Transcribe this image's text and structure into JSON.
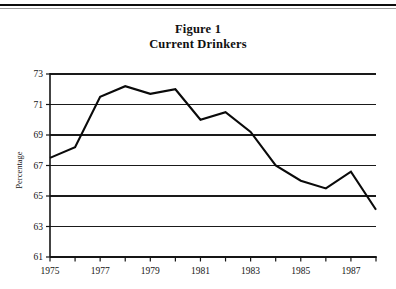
{
  "page": {
    "top_rule": "horizontal-rule"
  },
  "title": {
    "line1": "Figure 1",
    "line2": "Current Drinkers"
  },
  "chart_data": {
    "type": "line",
    "xlabel": "",
    "ylabel": "Percentage",
    "x": [
      1975,
      1976,
      1977,
      1978,
      1979,
      1980,
      1981,
      1982,
      1983,
      1984,
      1985,
      1986,
      1987,
      1988
    ],
    "values": [
      67.5,
      68.2,
      71.5,
      72.2,
      71.7,
      72.0,
      70.0,
      70.5,
      69.2,
      67.0,
      66.0,
      65.5,
      66.6,
      64.1
    ],
    "series": [
      {
        "name": "Current Drinkers",
        "values": [
          67.5,
          68.2,
          71.5,
          72.2,
          71.7,
          72.0,
          70.0,
          70.5,
          69.2,
          67.0,
          66.0,
          65.5,
          66.6,
          64.1
        ]
      }
    ],
    "xlim": [
      1975,
      1988
    ],
    "ylim": [
      61,
      73
    ],
    "ytick_values": [
      73,
      71,
      69,
      67,
      65,
      63,
      61
    ],
    "ytick_labels": [
      "73",
      "71",
      "69",
      "67",
      "65",
      "63",
      "61"
    ],
    "xtick_values": [
      1975,
      1976,
      1977,
      1978,
      1979,
      1980,
      1981,
      1982,
      1983,
      1984,
      1985,
      1986,
      1987,
      1988
    ],
    "xtick_labels": [
      "1975",
      "",
      "1977",
      "",
      "1979",
      "",
      "1981",
      "",
      "1983",
      "",
      "1985",
      "",
      "1987",
      ""
    ],
    "grid": "horizontal",
    "legend": "none",
    "line_color": "#0a0a0a",
    "grid_color": "#1a1a1a",
    "axis_color": "#151515"
  }
}
